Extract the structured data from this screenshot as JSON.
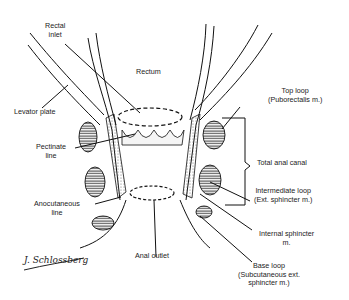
{
  "labels": {
    "rectal_inlet": [
      "Rectal",
      "inlet"
    ],
    "rectum": "Rectum",
    "levator_plate": "Levator plate",
    "pectinate_line": [
      "Pectinate",
      "line"
    ],
    "anocutaneous_line": [
      "Anocutaneous",
      "line"
    ],
    "anal_outlet": "Anal outlet",
    "top_loop": [
      "Top loop",
      "(Puborectalis m.)"
    ],
    "total_anal_canal": "Total anal canal",
    "intermediate_loop": [
      "Intermediate loop",
      "(Ext. sphincter m.)"
    ],
    "internal_sphincter": [
      "Internal sphincter",
      "m."
    ],
    "base_loop": [
      "Base loop",
      "(Subcutaneous ext.",
      "sphincter m.)"
    ]
  },
  "signature": "J. Schlossberg"
}
